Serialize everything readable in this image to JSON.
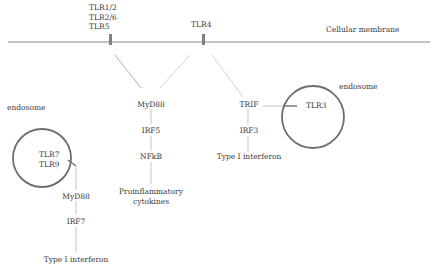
{
  "membrane": {
    "label": "Cellular membrane"
  },
  "receptors": {
    "tlr_surface_group": [
      "TLR1/2",
      "TLR2/6",
      "TLR5"
    ],
    "tlr4": "TLR4"
  },
  "left_endosome": {
    "label": "endosome",
    "receptors": [
      "TLR7",
      "TLR9"
    ],
    "pathway": [
      "MyD88",
      "IRF7",
      "Type I interferon"
    ]
  },
  "center_pathway": {
    "adaptor": "MyD88",
    "steps": [
      "IRF5",
      "NFkB"
    ],
    "output": [
      "Proinflammatory",
      "cytokines"
    ]
  },
  "trif_pathway": {
    "adaptor": "TRIF",
    "steps": [
      "IRF3"
    ],
    "output": "Type I interferon"
  },
  "right_endosome": {
    "label": "endosome",
    "receptor": "TLR3"
  },
  "colors": {
    "membrane": "#8a8a8a",
    "receptor": "#808080",
    "connector": "#b5b5b5",
    "endosome": "#6e6e6e",
    "text": "#3a3a3a"
  }
}
